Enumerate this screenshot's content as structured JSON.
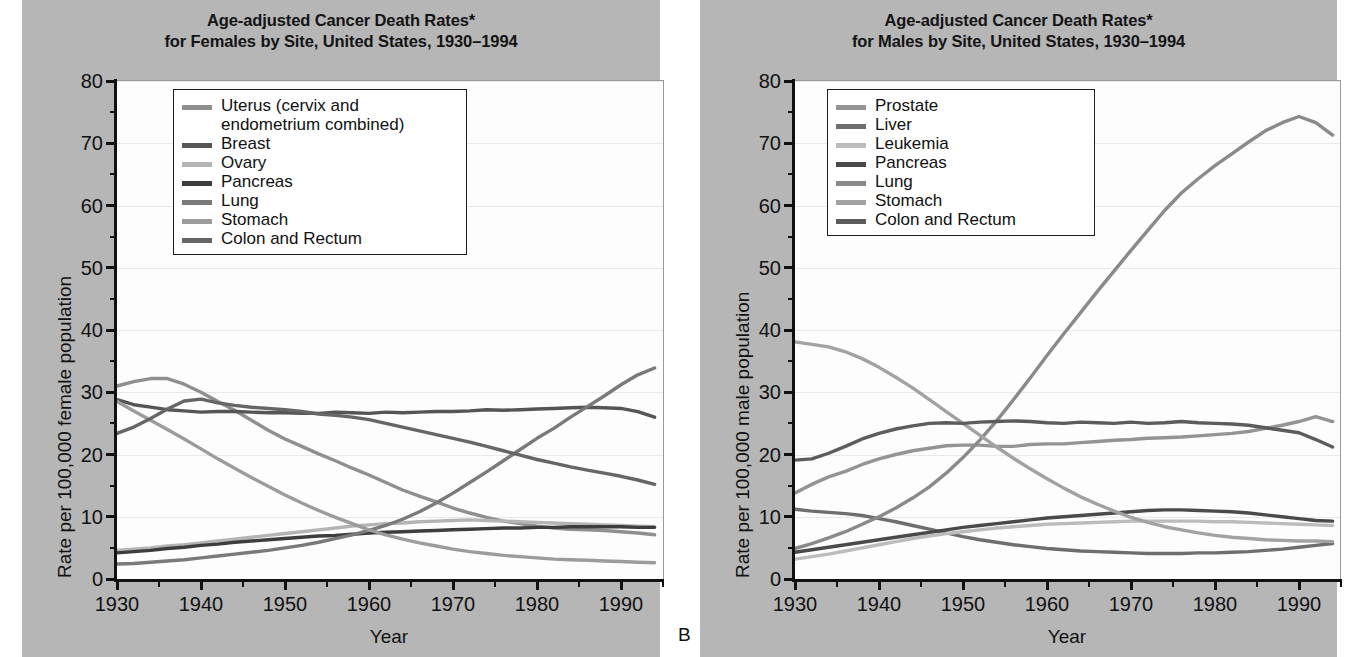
{
  "figure": {
    "background_color": "#b6b6b6",
    "plot_background_color": "#fdfdfd",
    "panel_letter": "B"
  },
  "panels": [
    {
      "id": "a",
      "title_line1": "Age-adjusted Cancer Death Rates*",
      "title_line2": "for Females by Site, United States, 1930–1994",
      "ylabel": "Rate per 100,000 female population",
      "xlabel": "Year",
      "yticks": [
        "0",
        "10",
        "20",
        "30",
        "40",
        "50",
        "60",
        "70",
        "80"
      ],
      "xticks": [
        "1930",
        "1940",
        "1950",
        "1960",
        "1970",
        "1980",
        "1990"
      ],
      "legend": [
        {
          "label": "Uterus (cervix and\nendometrium combined)",
          "color": "#8f8f8f"
        },
        {
          "label": "Breast",
          "color": "#555555"
        },
        {
          "label": "Ovary",
          "color": "#b4b4b4"
        },
        {
          "label": "Pancreas",
          "color": "#3d3d3d"
        },
        {
          "label": "Lung",
          "color": "#7a7a7a"
        },
        {
          "label": "Stomach",
          "color": "#9c9c9c"
        },
        {
          "label": "Colon and Rectum",
          "color": "#666666"
        }
      ]
    },
    {
      "id": "b",
      "title_line1": "Age-adjusted Cancer Death Rates*",
      "title_line2": "for Males by Site, United States, 1930–1994",
      "ylabel": "Rate per 100,000 male population",
      "xlabel": "Year",
      "yticks": [
        "0",
        "10",
        "20",
        "30",
        "40",
        "50",
        "60",
        "70",
        "80"
      ],
      "xticks": [
        "1930",
        "1940",
        "1950",
        "1960",
        "1970",
        "1980",
        "1990"
      ],
      "legend": [
        {
          "label": "Prostate",
          "color": "#949494"
        },
        {
          "label": "Liver",
          "color": "#6e6e6e"
        },
        {
          "label": "Leukemia",
          "color": "#bcbcbc"
        },
        {
          "label": "Pancreas",
          "color": "#4a4a4a"
        },
        {
          "label": "Lung",
          "color": "#8a8a8a"
        },
        {
          "label": "Stomach",
          "color": "#a2a2a2"
        },
        {
          "label": "Colon and Rectum",
          "color": "#5c5c5c"
        }
      ]
    }
  ],
  "chart_data": [
    {
      "type": "line",
      "title": "Age-adjusted Cancer Death Rates* for Females by Site, United States, 1930–1994",
      "xlabel": "Year",
      "ylabel": "Rate per 100,000 female population",
      "xlim": [
        1930,
        1995
      ],
      "ylim": [
        0,
        80
      ],
      "grid": true,
      "legend_position": "top-left",
      "x": [
        1930,
        1932,
        1934,
        1936,
        1938,
        1940,
        1942,
        1944,
        1946,
        1948,
        1950,
        1952,
        1954,
        1956,
        1958,
        1960,
        1962,
        1964,
        1966,
        1968,
        1970,
        1972,
        1974,
        1976,
        1978,
        1980,
        1982,
        1984,
        1986,
        1988,
        1990,
        1992,
        1994
      ],
      "series": [
        {
          "name": "Uterus (cervix and endometrium combined)",
          "color": "#8f8f8f",
          "values": [
            31.0,
            31.7,
            32.2,
            32.2,
            31.3,
            30.0,
            28.5,
            27.1,
            25.5,
            23.9,
            22.5,
            21.3,
            20.1,
            19.0,
            17.8,
            16.7,
            15.5,
            14.3,
            13.3,
            12.4,
            11.4,
            10.6,
            9.9,
            9.3,
            8.9,
            8.5,
            8.2,
            8.0,
            7.9,
            7.8,
            7.6,
            7.4,
            7.1
          ]
        },
        {
          "name": "Breast",
          "color": "#555555",
          "values": [
            28.8,
            28.0,
            27.6,
            27.2,
            27.0,
            26.8,
            26.9,
            26.9,
            26.8,
            26.7,
            26.7,
            26.6,
            26.6,
            26.8,
            26.7,
            26.6,
            26.8,
            26.7,
            26.8,
            26.9,
            26.9,
            27.0,
            27.2,
            27.1,
            27.2,
            27.3,
            27.4,
            27.5,
            27.6,
            27.5,
            27.4,
            26.9,
            26.0
          ]
        },
        {
          "name": "Ovary",
          "color": "#b4b4b4",
          "values": [
            4.6,
            4.8,
            5.0,
            5.3,
            5.5,
            5.8,
            6.1,
            6.4,
            6.7,
            7.0,
            7.3,
            7.6,
            7.9,
            8.2,
            8.5,
            8.7,
            8.9,
            9.0,
            9.2,
            9.3,
            9.4,
            9.5,
            9.4,
            9.3,
            9.2,
            9.1,
            9.0,
            8.9,
            8.8,
            8.7,
            8.6,
            8.5,
            8.4
          ]
        },
        {
          "name": "Pancreas",
          "color": "#3d3d3d",
          "values": [
            4.2,
            4.4,
            4.6,
            4.9,
            5.1,
            5.4,
            5.6,
            5.9,
            6.1,
            6.3,
            6.5,
            6.7,
            6.9,
            7.0,
            7.2,
            7.4,
            7.5,
            7.6,
            7.7,
            7.8,
            7.9,
            8.0,
            8.1,
            8.2,
            8.2,
            8.3,
            8.3,
            8.4,
            8.4,
            8.4,
            8.4,
            8.3,
            8.3
          ]
        },
        {
          "name": "Lung",
          "color": "#7a7a7a",
          "values": [
            2.4,
            2.5,
            2.7,
            2.9,
            3.1,
            3.4,
            3.7,
            4.0,
            4.3,
            4.6,
            5.0,
            5.4,
            5.9,
            6.5,
            7.1,
            7.8,
            8.6,
            9.6,
            10.8,
            12.2,
            13.8,
            15.5,
            17.2,
            19.0,
            20.8,
            22.6,
            24.2,
            26.0,
            27.7,
            29.4,
            31.2,
            32.8,
            33.9
          ]
        },
        {
          "name": "Stomach",
          "color": "#9c9c9c",
          "values": [
            28.5,
            27.0,
            25.5,
            24.0,
            22.5,
            20.9,
            19.3,
            17.8,
            16.3,
            14.9,
            13.5,
            12.2,
            11.0,
            9.9,
            8.9,
            7.9,
            7.1,
            6.4,
            5.8,
            5.3,
            4.8,
            4.4,
            4.1,
            3.8,
            3.6,
            3.4,
            3.2,
            3.1,
            3.0,
            2.9,
            2.8,
            2.7,
            2.6
          ]
        },
        {
          "name": "Colon and Rectum",
          "color": "#666666",
          "values": [
            23.4,
            24.4,
            25.8,
            27.3,
            28.6,
            28.9,
            28.3,
            27.9,
            27.6,
            27.4,
            27.2,
            26.9,
            26.5,
            26.3,
            26.0,
            25.6,
            25.0,
            24.4,
            23.8,
            23.2,
            22.6,
            22.0,
            21.3,
            20.6,
            19.9,
            19.2,
            18.6,
            18.0,
            17.5,
            17.0,
            16.5,
            15.9,
            15.2
          ]
        }
      ]
    },
    {
      "type": "line",
      "title": "Age-adjusted Cancer Death Rates* for Males by Site, United States, 1930–1994",
      "xlabel": "Year",
      "ylabel": "Rate per 100,000 male population",
      "xlim": [
        1930,
        1995
      ],
      "ylim": [
        0,
        80
      ],
      "grid": true,
      "legend_position": "top-left",
      "x": [
        1930,
        1932,
        1934,
        1936,
        1938,
        1940,
        1942,
        1944,
        1946,
        1948,
        1950,
        1952,
        1954,
        1956,
        1958,
        1960,
        1962,
        1964,
        1966,
        1968,
        1970,
        1972,
        1974,
        1976,
        1978,
        1980,
        1982,
        1984,
        1986,
        1988,
        1990,
        1992,
        1994
      ],
      "series": [
        {
          "name": "Prostate",
          "color": "#949494",
          "values": [
            13.8,
            15.2,
            16.4,
            17.3,
            18.4,
            19.3,
            20.0,
            20.6,
            21.0,
            21.4,
            21.5,
            21.5,
            21.3,
            21.3,
            21.6,
            21.7,
            21.7,
            21.9,
            22.1,
            22.3,
            22.4,
            22.6,
            22.7,
            22.8,
            23.0,
            23.2,
            23.4,
            23.7,
            24.2,
            24.7,
            25.3,
            26.1,
            25.3
          ]
        },
        {
          "name": "Liver",
          "color": "#6e6e6e",
          "values": [
            11.2,
            10.9,
            10.7,
            10.5,
            10.2,
            9.7,
            9.2,
            8.6,
            8.0,
            7.4,
            6.8,
            6.3,
            5.9,
            5.5,
            5.2,
            4.9,
            4.7,
            4.5,
            4.4,
            4.3,
            4.2,
            4.1,
            4.1,
            4.1,
            4.2,
            4.2,
            4.3,
            4.4,
            4.6,
            4.8,
            5.1,
            5.4,
            5.7
          ]
        },
        {
          "name": "Leukemia",
          "color": "#bcbcbc",
          "values": [
            3.2,
            3.6,
            4.0,
            4.5,
            5.0,
            5.5,
            6.0,
            6.5,
            6.9,
            7.3,
            7.6,
            7.9,
            8.2,
            8.4,
            8.6,
            8.8,
            8.9,
            9.0,
            9.1,
            9.2,
            9.3,
            9.3,
            9.3,
            9.3,
            9.3,
            9.2,
            9.2,
            9.1,
            9.0,
            8.9,
            8.8,
            8.7,
            8.6
          ]
        },
        {
          "name": "Pancreas",
          "color": "#4a4a4a",
          "values": [
            4.3,
            4.7,
            5.1,
            5.5,
            5.9,
            6.3,
            6.7,
            7.1,
            7.5,
            7.9,
            8.3,
            8.6,
            8.9,
            9.2,
            9.5,
            9.8,
            10.0,
            10.2,
            10.4,
            10.6,
            10.8,
            11.0,
            11.1,
            11.1,
            11.0,
            10.9,
            10.8,
            10.6,
            10.3,
            10.0,
            9.7,
            9.4,
            9.3
          ]
        },
        {
          "name": "Lung",
          "color": "#8a8a8a",
          "values": [
            4.9,
            5.7,
            6.6,
            7.6,
            8.8,
            10.0,
            11.4,
            13.0,
            14.8,
            17.0,
            19.5,
            22.3,
            25.4,
            28.8,
            32.3,
            35.9,
            39.4,
            42.8,
            46.2,
            49.5,
            52.8,
            56.0,
            59.2,
            62.0,
            64.3,
            66.4,
            68.3,
            70.2,
            72.0,
            73.3,
            74.3,
            73.3,
            71.3
          ]
        },
        {
          "name": "Stomach",
          "color": "#a2a2a2",
          "values": [
            38.1,
            37.7,
            37.3,
            36.5,
            35.4,
            34.0,
            32.4,
            30.7,
            28.8,
            26.9,
            25.0,
            23.1,
            21.2,
            19.4,
            17.7,
            16.1,
            14.6,
            13.2,
            12.0,
            10.9,
            9.9,
            9.1,
            8.4,
            7.9,
            7.4,
            7.0,
            6.7,
            6.5,
            6.3,
            6.2,
            6.1,
            6.1,
            6.0
          ]
        },
        {
          "name": "Colon and Rectum",
          "color": "#5c5c5c",
          "values": [
            19.1,
            19.3,
            20.2,
            21.3,
            22.5,
            23.4,
            24.1,
            24.6,
            25.0,
            25.1,
            25.0,
            25.2,
            25.3,
            25.4,
            25.3,
            25.1,
            25.0,
            25.2,
            25.1,
            25.0,
            25.2,
            25.0,
            25.1,
            25.3,
            25.1,
            25.0,
            24.9,
            24.7,
            24.3,
            23.9,
            23.5,
            22.4,
            21.2
          ]
        }
      ]
    }
  ]
}
